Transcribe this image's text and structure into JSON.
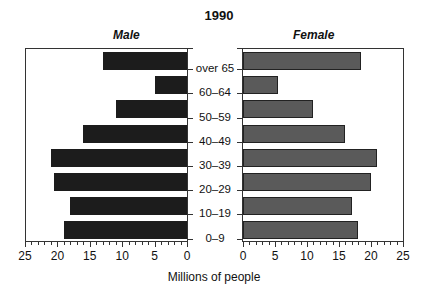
{
  "chart_data": {
    "type": "bar",
    "orientation": "horizontal",
    "layout": "population-pyramid",
    "title": "1990",
    "xlabel": "Millions of people",
    "ylabel": "",
    "categories": [
      "over 65",
      "60–64",
      "50–59",
      "40–49",
      "30–39",
      "20–29",
      "10–19",
      "0–9"
    ],
    "series": [
      {
        "name": "Male",
        "values": [
          13,
          5,
          11,
          16,
          21,
          20.5,
          18,
          19
        ],
        "color": "#1c1c1c"
      },
      {
        "name": "Female",
        "values": [
          18.5,
          5.5,
          11,
          16,
          21,
          20,
          17,
          18
        ],
        "color": "#5a5a5a"
      }
    ],
    "xlim": [
      0,
      25
    ],
    "male_ticks": [
      "25",
      "20",
      "15",
      "10",
      "5",
      "0"
    ],
    "female_ticks": [
      "0",
      "5",
      "10",
      "15",
      "20",
      "25"
    ],
    "minor_tick_step": 1,
    "grid": false,
    "legend": "panel titles above each side"
  },
  "labels": {
    "title": "1990",
    "male": "Male",
    "female": "Female",
    "xlabel": "Millions of people"
  }
}
